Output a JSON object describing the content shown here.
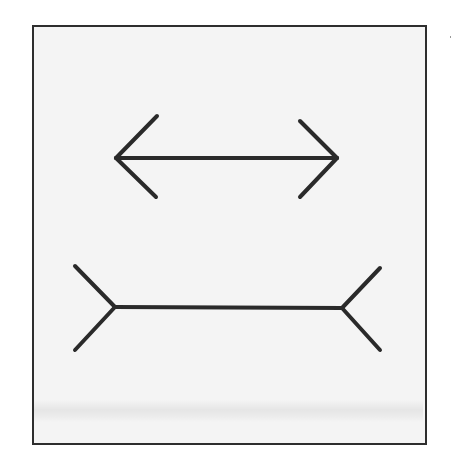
{
  "figure": {
    "colors": {
      "line": "#2a2a2a",
      "background": "#f4f4f4",
      "border": "#2e2e2e"
    },
    "top_figure": {
      "type": "arrowheads-inward",
      "shaft": {
        "x1": 116,
        "y1": 158,
        "x2": 337,
        "y2": 158
      },
      "left_wings": [
        [
          157,
          116
        ],
        [
          156,
          197
        ]
      ],
      "right_wings": [
        [
          300,
          121
        ],
        [
          300,
          197
        ]
      ]
    },
    "bottom_figure": {
      "type": "fins-outward",
      "shaft": {
        "x1": 115,
        "y1": 307,
        "x2": 342,
        "y2": 308
      },
      "left_wings": [
        [
          75,
          266
        ],
        [
          75,
          350
        ]
      ],
      "right_wings": [
        [
          380,
          268
        ],
        [
          380,
          350
        ]
      ]
    }
  }
}
